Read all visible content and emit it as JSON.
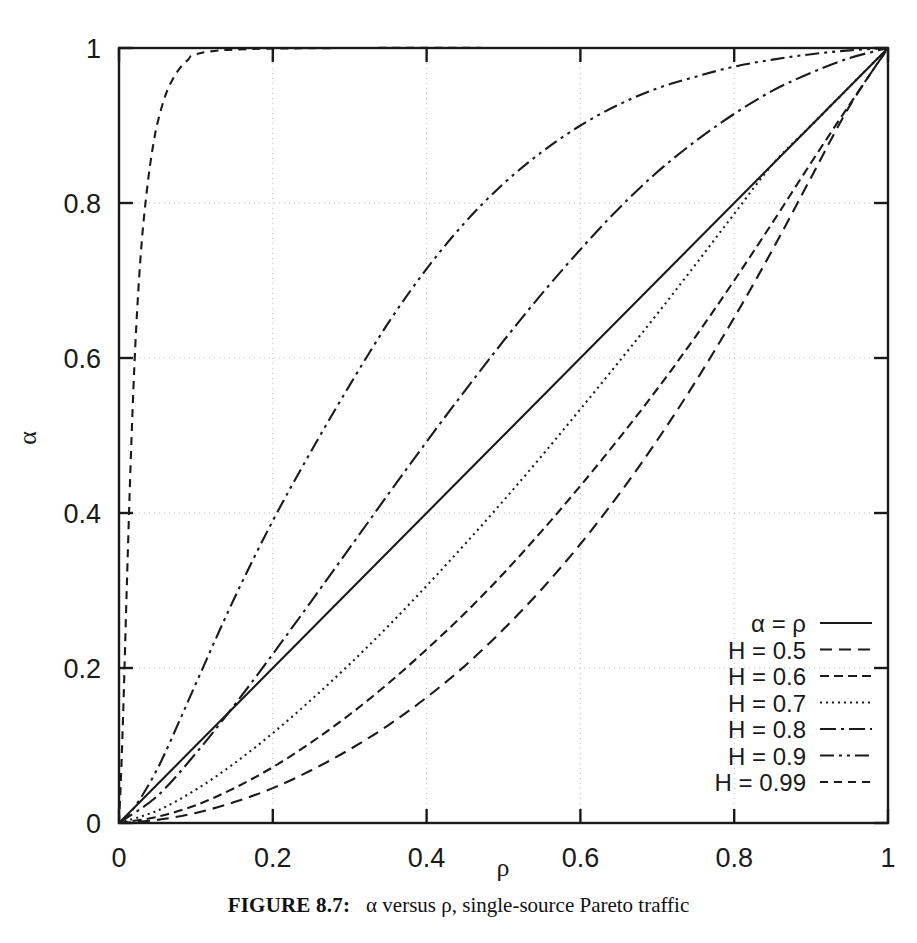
{
  "figure": {
    "caption_label": "FIGURE 8.7:",
    "caption_alpha": "α",
    "caption_mid": " versus ",
    "caption_rho": "ρ",
    "caption_tail": ", single-source Pareto traffic"
  },
  "chart_data": {
    "type": "line",
    "title": "",
    "xlabel": "ρ",
    "ylabel": "α",
    "xlim": [
      0,
      1
    ],
    "ylim": [
      0,
      1
    ],
    "xticks": [
      0,
      0.2,
      0.4,
      0.6,
      0.8,
      1
    ],
    "yticks": [
      0,
      0.2,
      0.4,
      0.6,
      0.8,
      1
    ],
    "xticklabels": [
      "0",
      "0.2",
      "0.4",
      "0.6",
      "0.8",
      "1"
    ],
    "yticklabels": [
      "0",
      "0.2",
      "0.4",
      "0.6",
      "0.8",
      "1"
    ],
    "grid": true,
    "grid_style": "dotted",
    "legend_position": "lower-right",
    "line_color": "#1a1a1a",
    "series": [
      {
        "name": "α = ρ",
        "dash": "none",
        "x": [
          0,
          1
        ],
        "y": [
          0,
          1
        ]
      },
      {
        "name": "H = 0.5",
        "dash": "12,7",
        "x": [
          0,
          0.05,
          0.1,
          0.15,
          0.2,
          0.25,
          0.3,
          0.35,
          0.4,
          0.45,
          0.5,
          0.55,
          0.6,
          0.65,
          0.7,
          0.75,
          0.8,
          0.85,
          0.9,
          0.95,
          1
        ],
        "y": [
          0,
          0.004,
          0.013,
          0.027,
          0.045,
          0.068,
          0.095,
          0.126,
          0.162,
          0.203,
          0.25,
          0.302,
          0.36,
          0.424,
          0.494,
          0.57,
          0.652,
          0.74,
          0.833,
          0.925,
          1
        ]
      },
      {
        "name": "H = 0.6",
        "dash": "9,5",
        "x": [
          0,
          0.05,
          0.1,
          0.15,
          0.2,
          0.25,
          0.3,
          0.35,
          0.4,
          0.45,
          0.5,
          0.55,
          0.6,
          0.65,
          0.7,
          0.75,
          0.8,
          0.85,
          0.9,
          0.95,
          1
        ],
        "y": [
          0,
          0.008,
          0.023,
          0.045,
          0.072,
          0.104,
          0.14,
          0.18,
          0.224,
          0.271,
          0.322,
          0.377,
          0.435,
          0.496,
          0.56,
          0.628,
          0.7,
          0.775,
          0.852,
          0.927,
          1
        ]
      },
      {
        "name": "H = 0.7",
        "dash": "2,4",
        "x": [
          0,
          0.05,
          0.1,
          0.15,
          0.2,
          0.25,
          0.3,
          0.35,
          0.4,
          0.45,
          0.5,
          0.55,
          0.6,
          0.65,
          0.7,
          0.75,
          0.8,
          0.85,
          0.9,
          0.95,
          1
        ],
        "y": [
          0,
          0.016,
          0.043,
          0.077,
          0.116,
          0.159,
          0.205,
          0.254,
          0.306,
          0.36,
          0.416,
          0.474,
          0.534,
          0.595,
          0.657,
          0.721,
          0.786,
          0.85,
          0.9,
          0.95,
          1
        ]
      },
      {
        "name": "H = 0.8",
        "dash": "16,5,3,5",
        "x": [
          0,
          0.05,
          0.1,
          0.15,
          0.2,
          0.25,
          0.3,
          0.35,
          0.4,
          0.45,
          0.5,
          0.55,
          0.6,
          0.65,
          0.7,
          0.75,
          0.8,
          0.85,
          0.9,
          0.95,
          1
        ],
        "y": [
          0,
          0.035,
          0.09,
          0.152,
          0.218,
          0.286,
          0.355,
          0.424,
          0.492,
          0.558,
          0.622,
          0.683,
          0.74,
          0.793,
          0.84,
          0.88,
          0.915,
          0.945,
          0.968,
          0.987,
          1
        ]
      },
      {
        "name": "H = 0.9",
        "dash": "14,5,3,5,3,5",
        "x": [
          0,
          0.02,
          0.05,
          0.08,
          0.1,
          0.15,
          0.2,
          0.25,
          0.3,
          0.35,
          0.4,
          0.45,
          0.5,
          0.55,
          0.6,
          0.65,
          0.7,
          0.75,
          0.8,
          0.85,
          0.9,
          0.95,
          1
        ],
        "y": [
          0,
          0.02,
          0.07,
          0.135,
          0.18,
          0.29,
          0.39,
          0.48,
          0.565,
          0.645,
          0.715,
          0.775,
          0.825,
          0.866,
          0.9,
          0.927,
          0.948,
          0.963,
          0.976,
          0.985,
          0.992,
          0.997,
          1
        ]
      },
      {
        "name": "H = 0.99",
        "dash": "8,6",
        "x": [
          0,
          0.003,
          0.006,
          0.01,
          0.015,
          0.02,
          0.025,
          0.03,
          0.035,
          0.04,
          0.045,
          0.05,
          0.06,
          0.07,
          0.08,
          0.09,
          0.1,
          0.15,
          0.3,
          0.6,
          1
        ],
        "y": [
          0,
          0.07,
          0.16,
          0.3,
          0.46,
          0.59,
          0.685,
          0.755,
          0.805,
          0.846,
          0.878,
          0.903,
          0.938,
          0.96,
          0.975,
          0.985,
          0.992,
          0.998,
          1,
          1,
          1
        ]
      }
    ]
  },
  "legend": {
    "items": [
      {
        "label": "α = ρ"
      },
      {
        "label": "H = 0.5"
      },
      {
        "label": "H = 0.6"
      },
      {
        "label": "H = 0.7"
      },
      {
        "label": "H = 0.8"
      },
      {
        "label": "H = 0.9"
      },
      {
        "label": "H = 0.99"
      }
    ]
  }
}
